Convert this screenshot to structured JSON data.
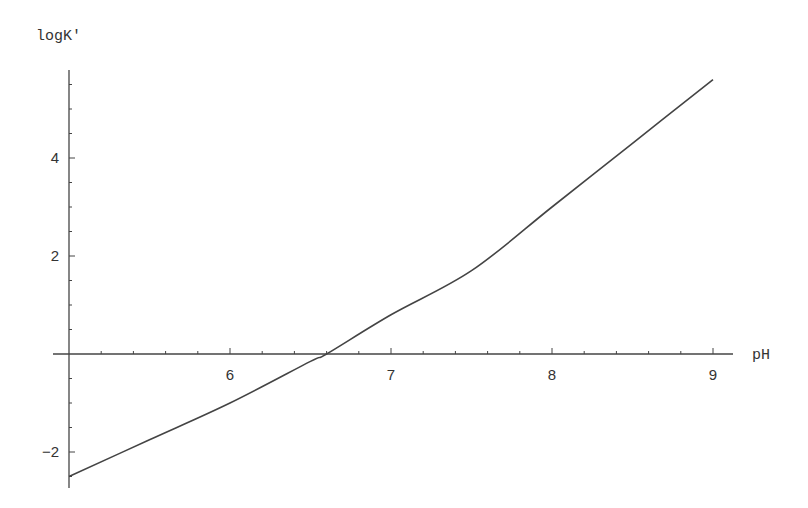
{
  "chart_data": {
    "type": "line",
    "title": "",
    "xlabel": "pH",
    "ylabel": "logK'",
    "xlim": [
      5,
      9.1
    ],
    "ylim": [
      -2.7,
      5.8
    ],
    "grid": false,
    "legend": null,
    "x_ticks": [
      6,
      7,
      8,
      9
    ],
    "y_ticks": [
      -2,
      2,
      4
    ],
    "x_tick_labels": [
      "6",
      "7",
      "8",
      "9"
    ],
    "y_tick_labels": [
      "-2",
      "2",
      "4"
    ],
    "series": [
      {
        "name": "logK'",
        "x": [
          5.0,
          5.5,
          6.0,
          6.5,
          6.6,
          7.0,
          7.5,
          8.0,
          8.5,
          9.0
        ],
        "y": [
          -2.5,
          -1.75,
          -1.0,
          -0.15,
          0.0,
          0.8,
          1.7,
          3.0,
          4.3,
          5.6
        ]
      }
    ]
  }
}
